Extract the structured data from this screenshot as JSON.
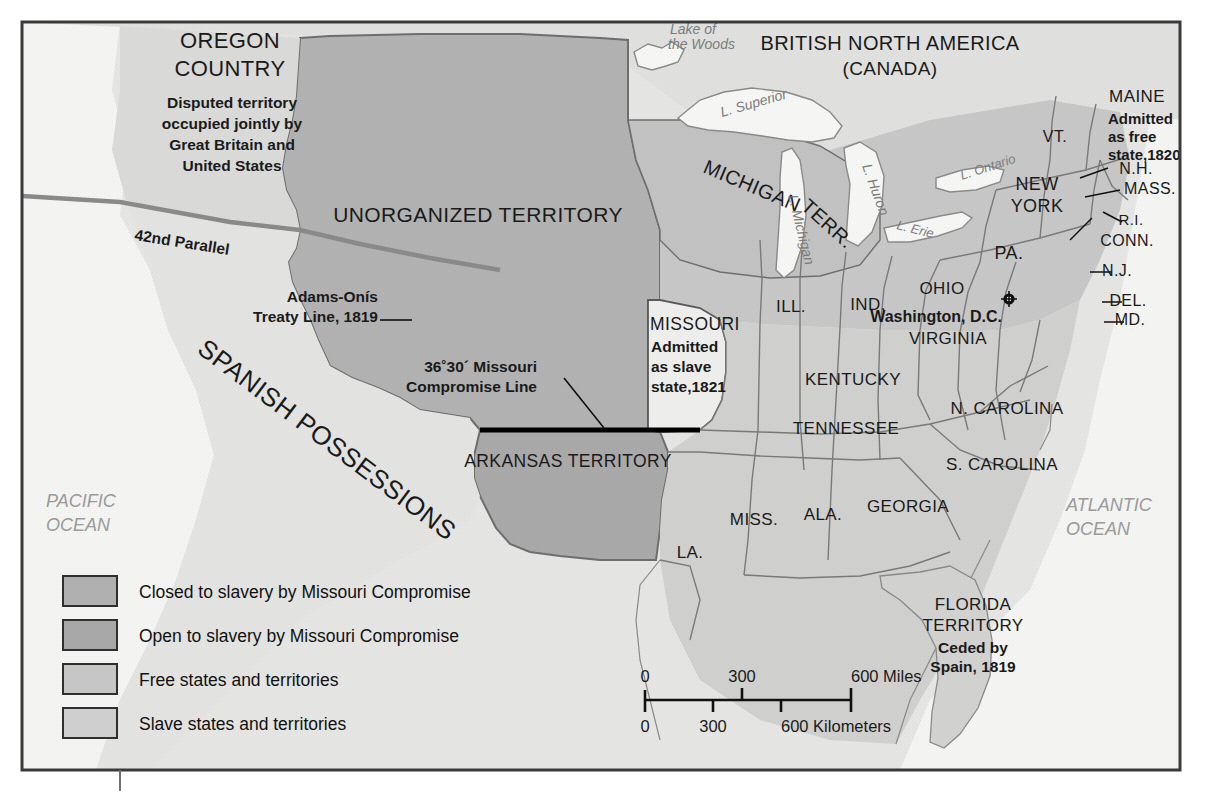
{
  "map": {
    "title_regions": {
      "oregon_country": "OREGON\nCOUNTRY",
      "oregon_note_l1": "Disputed territory",
      "oregon_note_l2": "occupied jointly by",
      "oregon_note_l3": "Great Britain and",
      "oregon_note_l4": "United States",
      "unorganized": "UNORGANIZED TERRITORY",
      "british_na_l1": "BRITISH NORTH AMERICA",
      "british_na_l2": "(CANADA)",
      "spanish": "SPANISH POSSESSIONS",
      "arkansas": "ARKANSAS TERRITORY",
      "michigan_l1": "MICHIGAN",
      "michigan_l2": "TERR.",
      "florida_l1": "FLORIDA",
      "florida_l2": "TERRITORY",
      "florida_note_l1": "Ceded by",
      "florida_note_l2": "Spain, 1819"
    },
    "annotations": {
      "parallel_42": "42nd Parallel",
      "adams_onis_l1": "Adams-Onís",
      "adams_onis_l2": "Treaty Line, 1819",
      "compromise_l1": "36˚30´ Missouri",
      "compromise_l2": "Compromise Line",
      "missouri_name": "MISSOURI",
      "missouri_note_l1": "Admitted",
      "missouri_note_l2": "as slave",
      "missouri_note_l3": "state,1821",
      "maine_name": "MAINE",
      "maine_note_l1": "Admitted",
      "maine_note_l2": "as free",
      "maine_note_l3": "state,1820",
      "capital": "Washington, D.C."
    },
    "states": [
      {
        "name": "ILL.",
        "x": 791,
        "y": 312,
        "size": 17
      },
      {
        "name": "IND.",
        "x": 868,
        "y": 310,
        "size": 17
      },
      {
        "name": "OHIO",
        "x": 942,
        "y": 294,
        "size": 17
      },
      {
        "name": "PA.",
        "x": 1009,
        "y": 259,
        "size": 18
      },
      {
        "name": "NEW",
        "x": 1037,
        "y": 190,
        "size": 18
      },
      {
        "name": "YORK",
        "x": 1037,
        "y": 212,
        "size": 18
      },
      {
        "name": "VT.",
        "x": 1055,
        "y": 142,
        "size": 16
      },
      {
        "name": "N.H.",
        "x": 1136,
        "y": 174,
        "size": 16
      },
      {
        "name": "MASS.",
        "x": 1150,
        "y": 194,
        "size": 16
      },
      {
        "name": "R.I.",
        "x": 1131,
        "y": 225,
        "size": 15
      },
      {
        "name": "CONN.",
        "x": 1127,
        "y": 246,
        "size": 16
      },
      {
        "name": "N.J.",
        "x": 1117,
        "y": 276,
        "size": 16
      },
      {
        "name": "DEL.",
        "x": 1128,
        "y": 306,
        "size": 16
      },
      {
        "name": "MD.",
        "x": 1130,
        "y": 325,
        "size": 16
      },
      {
        "name": "VIRGINIA",
        "x": 948,
        "y": 344,
        "size": 17
      },
      {
        "name": "KENTUCKY",
        "x": 853,
        "y": 385,
        "size": 17
      },
      {
        "name": "TENNESSEE",
        "x": 846,
        "y": 434,
        "size": 17
      },
      {
        "name": "N. CAROLINA",
        "x": 1007,
        "y": 414,
        "size": 17
      },
      {
        "name": "S. CAROLINA",
        "x": 1002,
        "y": 470,
        "size": 17
      },
      {
        "name": "GEORGIA",
        "x": 908,
        "y": 512,
        "size": 17
      },
      {
        "name": "ALA.",
        "x": 823,
        "y": 520,
        "size": 17
      },
      {
        "name": "MISS.",
        "x": 754,
        "y": 525,
        "size": 17
      },
      {
        "name": "LA.",
        "x": 690,
        "y": 558,
        "size": 17
      }
    ],
    "lakes": [
      {
        "name": "Lake of",
        "x": 670,
        "y": 34,
        "size": 14,
        "rot": 0
      },
      {
        "name": "the Woods",
        "x": 668,
        "y": 49,
        "size": 14,
        "rot": 0
      },
      {
        "name": "L. Superior",
        "x": 722,
        "y": 117,
        "size": 14,
        "rot": -16
      },
      {
        "name": "L. Michigan",
        "x": 788,
        "y": 196,
        "size": 14,
        "rot": 76
      },
      {
        "name": "L. Huron",
        "x": 862,
        "y": 166,
        "size": 14,
        "rot": 70
      },
      {
        "name": "L. Ontario",
        "x": 962,
        "y": 180,
        "size": 13,
        "rot": -18
      },
      {
        "name": "L. Erie",
        "x": 896,
        "y": 229,
        "size": 13,
        "rot": 14
      }
    ],
    "oceans": [
      {
        "l1": "PACIFIC",
        "l2": "OCEAN",
        "x": 46,
        "y": 507
      },
      {
        "l1": "ATLANTIC",
        "l2": "OCEAN",
        "x": 1066,
        "y": 511
      }
    ],
    "legend": {
      "items": [
        {
          "label": "Closed to slavery by Missouri Compromise",
          "color": "#b0b0b0"
        },
        {
          "label": "Open to slavery by Missouri Compromise",
          "color": "#a8a8a8"
        },
        {
          "label": "Free states and territories",
          "color": "#c6c6c6"
        },
        {
          "label": "Slave states and territories",
          "color": "#cfcfcf"
        }
      ]
    },
    "scale": {
      "miles_ticks": [
        "0",
        "300",
        "600 Miles"
      ],
      "km_ticks": [
        "0",
        "300",
        "600 Kilometers"
      ]
    },
    "colors": {
      "closed_to_slavery": "#b0b0b0",
      "open_to_slavery": "#a8a8a8",
      "free_states": "#c6c6c6",
      "slave_states": "#cfcfcf",
      "outside": "#e2e2e0",
      "water": "#f3f3f1",
      "frame": "#3a3a3a",
      "compromise_line": "#000000",
      "boundary": "#6e6e6e"
    }
  }
}
